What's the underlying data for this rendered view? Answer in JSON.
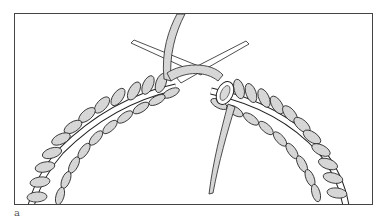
{
  "figure": {
    "caption_label": "a",
    "colors": {
      "frame": "#444444",
      "yarn_fill": "#d9d9d9",
      "outline": "#222222",
      "background": "#ffffff"
    }
  }
}
